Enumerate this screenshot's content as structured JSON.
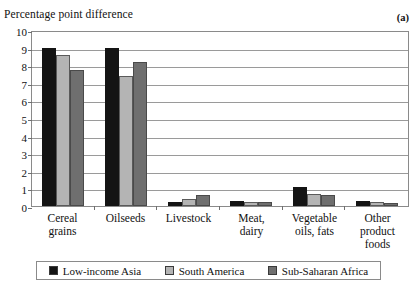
{
  "chart_data": {
    "type": "bar",
    "title": "",
    "panel_label": "(a)",
    "ylabel": "Percentage point difference",
    "xlabel": "",
    "ylim": [
      0,
      10
    ],
    "yticks": [
      10,
      9,
      8,
      7,
      6,
      5,
      4,
      3,
      2,
      1,
      0
    ],
    "grid": true,
    "legend_position": "bottom",
    "categories": [
      "Cereal\ngrains",
      "Oilseeds",
      "Livestock",
      "Meat,\ndairy",
      "Vegetable\noils, fats",
      "Other\nproduct\nfoods"
    ],
    "series": [
      {
        "name": "Low-income Asia",
        "color": "#141414",
        "values": [
          9.0,
          9.0,
          0.25,
          0.3,
          1.1,
          0.3
        ]
      },
      {
        "name": "South America",
        "color": "#b4b4b4",
        "values": [
          8.6,
          7.4,
          0.4,
          0.2,
          0.7,
          0.2
        ]
      },
      {
        "name": "Sub-Saharan Africa",
        "color": "#6f6f6f",
        "values": [
          7.7,
          8.2,
          0.65,
          0.2,
          0.65,
          0.15
        ]
      }
    ]
  }
}
